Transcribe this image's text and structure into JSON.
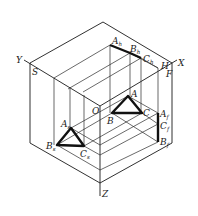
{
  "figure": {
    "type": "three-plane projection of a triangle in an isometric box",
    "axes": {
      "x": "X",
      "y": "Y",
      "z": "Z",
      "origin": "O"
    },
    "planes": {
      "horizontal": "H",
      "frontal": "F",
      "side": "S"
    },
    "triangle_space": {
      "A": "A",
      "B": "B",
      "C": "C"
    },
    "projection_h": {
      "A": "A",
      "A_sub": "h",
      "B": "B",
      "B_sub": "h",
      "C": "C",
      "C_sub": "h"
    },
    "projection_f": {
      "A": "A",
      "A_sub": "f",
      "B": "B",
      "B_sub": "f",
      "C": "C",
      "C_sub": "f"
    },
    "projection_s": {
      "A": "A",
      "A_sub": "s",
      "B": "B",
      "B_sub": "s",
      "C": "C",
      "C_sub": "s"
    }
  }
}
